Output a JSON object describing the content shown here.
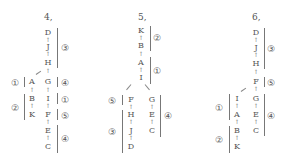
{
  "diagrams": [
    {
      "title": "4,",
      "main_chain": [
        "D",
        "J",
        "H",
        "G",
        "I",
        "F",
        "E",
        "C"
      ],
      "side_chain": [
        "A",
        "B",
        "K"
      ],
      "groups": [
        {
          "label": "③",
          "members": [
            "D",
            "J",
            "H"
          ]
        },
        {
          "label": "④",
          "members": [
            "G"
          ]
        },
        {
          "label": "①",
          "members": [
            "I"
          ]
        },
        {
          "label": "⑤",
          "members": [
            "F"
          ]
        },
        {
          "label": "④",
          "members": [
            "E",
            "C"
          ]
        },
        {
          "label": "①",
          "members": [
            "A"
          ]
        },
        {
          "label": "②",
          "members": [
            "B",
            "K"
          ]
        }
      ]
    },
    {
      "title": "5,",
      "main_chain": [
        "K",
        "B",
        "A",
        "I"
      ],
      "left_branch": [
        "F",
        "H",
        "J",
        "D"
      ],
      "right_branch": [
        "G",
        "E",
        "C"
      ],
      "groups": [
        {
          "label": "②",
          "members": [
            "K",
            "B"
          ]
        },
        {
          "label": "①",
          "members": [
            "A",
            "I"
          ]
        },
        {
          "label": "⑤",
          "members": [
            "F"
          ]
        },
        {
          "label": "③",
          "members": [
            "H",
            "J",
            "D"
          ]
        },
        {
          "label": "④",
          "members": [
            "G",
            "E",
            "C"
          ]
        }
      ]
    },
    {
      "title": "6,",
      "main_chain": [
        "D",
        "J",
        "H",
        "F",
        "G",
        "E",
        "C"
      ],
      "side_chain": [
        "I",
        "A",
        "B",
        "K"
      ],
      "groups": [
        {
          "label": "③",
          "members": [
            "D",
            "J",
            "H"
          ]
        },
        {
          "label": "⑤",
          "members": [
            "F"
          ]
        },
        {
          "label": "④",
          "members": [
            "G",
            "E",
            "C"
          ]
        },
        {
          "label": "①",
          "members": [
            "I",
            "A"
          ]
        },
        {
          "label": "②",
          "members": [
            "B",
            "K"
          ]
        }
      ]
    }
  ],
  "arrow_glyph": "↑"
}
